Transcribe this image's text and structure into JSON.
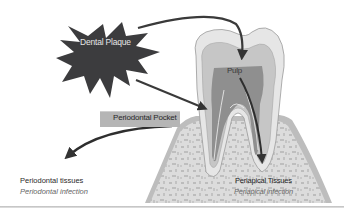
{
  "diagram": {
    "nodes": {
      "plaque": {
        "label": "Dental Plaque",
        "icon": "starburst-icon",
        "color": "#3c3c3e"
      },
      "pulp": {
        "label": "Pulp"
      },
      "pocket": {
        "label": "Periodontal Pocket",
        "color": "#b5b5b5"
      },
      "periodontal": {
        "title": "Periodontal tissues",
        "subtitle": "Periodontal infection"
      },
      "periapical": {
        "title": "Periapical Tissues",
        "subtitle": "Periapical infection"
      }
    },
    "edges": [
      {
        "from": "Dental Plaque",
        "to": "Pulp"
      },
      {
        "from": "Dental Plaque",
        "to": "Periodontal Pocket"
      },
      {
        "from": "Periodontal Pocket",
        "to": "Periodontal tissues"
      },
      {
        "from": "Pulp",
        "to": "Periapical Tissues"
      }
    ],
    "colors": {
      "arrow": "#3a3a3a",
      "enamel": "#e2e2e2",
      "dentin": "#c4c4c4",
      "pulp": "#8e8e8e",
      "bone": "#d8d8d8",
      "gum": "#bdbdbd"
    }
  }
}
